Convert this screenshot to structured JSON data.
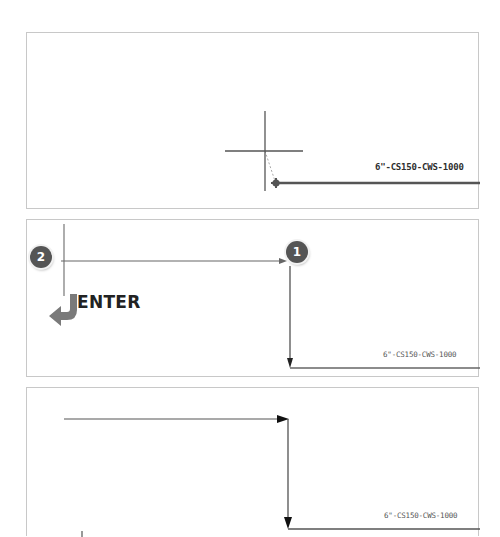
{
  "colors": {
    "panel_border": "#c8c8c8",
    "pipe_line": "#555555",
    "badge_fill": "#555555",
    "enter_arrow": "#777777"
  },
  "panels": [
    {
      "id": "step-cursor",
      "pipe_label": "6\"-CS150-CWS-1000",
      "cursor_icon": "crosshair-icon",
      "endpoint_icon": "grip-endpoint-icon"
    },
    {
      "id": "step-route",
      "pipe_label": "6\"-CS150-CWS-1000",
      "points": [
        {
          "number": "1",
          "role": "first-pick-point"
        },
        {
          "number": "2",
          "role": "second-pick-point"
        }
      ],
      "enter_label": "ENTER",
      "enter_icon": "enter-return-arrow-icon"
    },
    {
      "id": "step-result",
      "pipe_label": "6\"-CS150-CWS-1000"
    }
  ]
}
